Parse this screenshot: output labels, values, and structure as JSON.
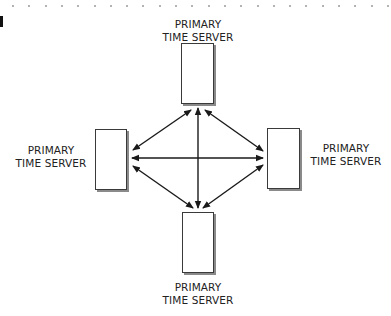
{
  "diagram": {
    "type": "network-topology",
    "nodes": [
      {
        "id": "top",
        "line1": "PRIMARY",
        "line2": "TIME SERVER"
      },
      {
        "id": "left",
        "line1": "PRIMARY",
        "line2": "TIME SERVER"
      },
      {
        "id": "right",
        "line1": "PRIMARY",
        "line2": "TIME SERVER"
      },
      {
        "id": "bottom",
        "line1": "PRIMARY",
        "line2": "TIME SERVER"
      }
    ],
    "edges": [
      {
        "from": "top",
        "to": "bottom",
        "direction": "bidirectional"
      },
      {
        "from": "left",
        "to": "right",
        "direction": "bidirectional"
      },
      {
        "from": "top",
        "to": "left",
        "direction": "bidirectional"
      },
      {
        "from": "top",
        "to": "right",
        "direction": "bidirectional"
      },
      {
        "from": "bottom",
        "to": "left",
        "direction": "bidirectional"
      },
      {
        "from": "bottom",
        "to": "right",
        "direction": "bidirectional"
      }
    ],
    "colors": {
      "line": "#1a1a1a",
      "box_border": "#3a3a3a",
      "box_shadow": "#8a8a8a",
      "text": "#222222"
    }
  }
}
